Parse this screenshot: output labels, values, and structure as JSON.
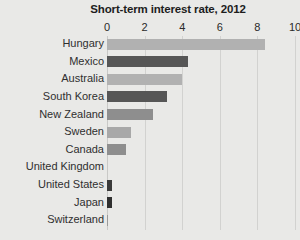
{
  "chart_data": {
    "type": "bar",
    "orientation": "horizontal",
    "title": "Short-term interest rate, 2012",
    "xlabel": "",
    "ylabel": "",
    "xlim": [
      0,
      10
    ],
    "xticks": [
      0,
      2,
      4,
      6,
      8,
      10
    ],
    "xtick_labels": [
      "0",
      "2",
      "4",
      "6",
      "8",
      "10"
    ],
    "grid": "vertical",
    "legend": "none",
    "categories": [
      "Hungary",
      "Mexico",
      "Australia",
      "South Korea",
      "New Zealand",
      "Sweden",
      "Canada",
      "United Kingdom",
      "United States",
      "Japan",
      "Switzerland"
    ],
    "values": [
      8.4,
      4.3,
      4.0,
      3.2,
      2.45,
      1.3,
      1.0,
      0.0,
      0.25,
      0.25,
      0.05
    ],
    "bar_colors": [
      "#b1b1b1",
      "#565656",
      "#b1b1b1",
      "#565656",
      "#8e8e8e",
      "#a8a8a8",
      "#8e8e8e",
      "#565656",
      "#3a3a3a",
      "#2f2f2f",
      "#9a9a9a"
    ]
  },
  "style": {
    "background": "#e9e9e7",
    "gridline_color": "#d2d2d0",
    "text_color": "#2f2f2f",
    "title_color": "#1d1d1d"
  }
}
